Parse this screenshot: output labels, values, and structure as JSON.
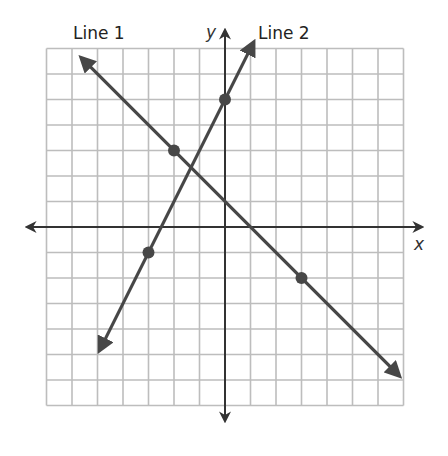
{
  "chart_data": {
    "type": "line",
    "title": "",
    "xlabel": "x",
    "ylabel": "y",
    "xlim": [
      -7,
      7
    ],
    "ylim": [
      -7,
      7
    ],
    "grid": true,
    "grid_step": 1,
    "axes_arrows": true,
    "tick_labels": false,
    "series": [
      {
        "name": "Line 1",
        "equation": "y = -x + 1",
        "slope": -1,
        "intercept": 1,
        "points": [
          [
            -2,
            3
          ],
          [
            3,
            -2
          ]
        ],
        "endpoints": [
          [
            -5.6,
            6.6
          ],
          [
            6.8,
            -5.8
          ]
        ]
      },
      {
        "name": "Line 2",
        "equation": "y = 2x + 5",
        "slope": 2,
        "intercept": 5,
        "points": [
          [
            0,
            5
          ],
          [
            -3,
            -1
          ]
        ],
        "endpoints": [
          [
            -4.9,
            -4.8
          ],
          [
            1.1,
            7.2
          ]
        ]
      }
    ],
    "legend": "inline labels near arrow tips"
  },
  "labels": {
    "line1": "Line 1",
    "line2": "Line 2",
    "x_axis": "x",
    "y_axis": "y"
  },
  "colors": {
    "grid": "#bdbdbd",
    "axis": "#333333",
    "line": "#474747",
    "point": "#474747"
  }
}
